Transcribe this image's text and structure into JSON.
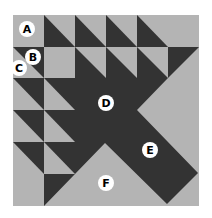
{
  "diagram": {
    "colors": {
      "light": "#b4b4b4",
      "dark": "#333333",
      "label_fill": "#ffffff",
      "label_text": "#000000",
      "background": "#ffffff"
    },
    "labels": [
      {
        "id": "A",
        "text": "A",
        "piece": "light square"
      },
      {
        "id": "B",
        "text": "B",
        "piece": "dark half-square triangle"
      },
      {
        "id": "C",
        "text": "C",
        "piece": "light half-square triangle"
      },
      {
        "id": "D",
        "text": "D",
        "piece": "dark center"
      },
      {
        "id": "E",
        "text": "E",
        "piece": "dark diagonal band"
      },
      {
        "id": "F",
        "text": "F",
        "piece": "light large triangle"
      }
    ]
  }
}
